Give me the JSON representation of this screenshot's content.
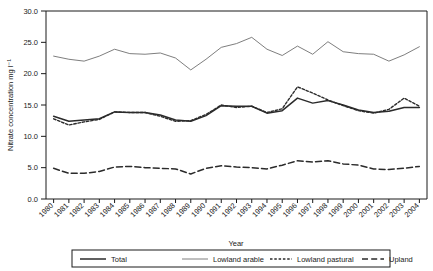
{
  "chart_data": {
    "type": "line",
    "title": "",
    "xlabel": "Year",
    "ylabel": "Nitrate concentration mg l⁻¹",
    "ylim": [
      0.0,
      30.0
    ],
    "yticks": [
      "0.0",
      "5.0",
      "10.0",
      "15.0",
      "20.0",
      "25.0",
      "30.0"
    ],
    "ytick_values": [
      0,
      5,
      10,
      15,
      20,
      25,
      30
    ],
    "grid": false,
    "legend_position": "bottom",
    "x": [
      1980,
      1981,
      1982,
      1983,
      1984,
      1985,
      1986,
      1987,
      1988,
      1989,
      1990,
      1991,
      1992,
      1993,
      1994,
      1995,
      1996,
      1997,
      1998,
      1999,
      2000,
      2001,
      2002,
      2003,
      2004
    ],
    "categories": [
      "1980",
      "1981",
      "1982",
      "1983",
      "1984",
      "1985",
      "1986",
      "1987",
      "1988",
      "1989",
      "1990",
      "1991",
      "1992",
      "1993",
      "1994",
      "1995",
      "1996",
      "1997",
      "1998",
      "1999",
      "2000",
      "2001",
      "2002",
      "2003",
      "2004"
    ],
    "series": [
      {
        "name": "Total",
        "style": "solid-thick",
        "color": "#2b2b2b",
        "values": [
          13.2,
          12.4,
          12.6,
          12.8,
          13.9,
          13.8,
          13.8,
          13.4,
          12.6,
          12.4,
          13.3,
          14.9,
          14.8,
          14.8,
          13.7,
          14.1,
          16.1,
          15.3,
          15.7,
          15.0,
          14.2,
          13.8,
          14.0,
          14.6,
          14.6
        ]
      },
      {
        "name": "Lowland arable",
        "style": "solid-thin",
        "color": "#6f6f6f",
        "values": [
          22.8,
          22.3,
          22.0,
          22.8,
          23.9,
          23.2,
          23.1,
          23.3,
          22.5,
          20.6,
          22.3,
          24.2,
          24.8,
          25.8,
          23.9,
          22.9,
          24.4,
          23.1,
          25.1,
          23.5,
          23.2,
          23.1,
          22.0,
          23.0,
          24.3
        ]
      },
      {
        "name": "Lowland pastural",
        "style": "dotted",
        "color": "#2b2b2b",
        "values": [
          12.8,
          11.8,
          12.3,
          12.7,
          13.9,
          13.8,
          13.8,
          13.2,
          12.4,
          12.5,
          13.5,
          15.0,
          14.6,
          14.8,
          13.8,
          14.4,
          17.9,
          16.9,
          15.8,
          14.9,
          14.1,
          13.7,
          14.3,
          16.1,
          14.8
        ]
      },
      {
        "name": "Upland",
        "style": "dashed",
        "color": "#2b2b2b",
        "values": [
          4.9,
          4.1,
          4.1,
          4.4,
          5.1,
          5.2,
          5.0,
          4.9,
          4.8,
          4.0,
          4.9,
          5.3,
          5.1,
          5.0,
          4.8,
          5.4,
          6.1,
          5.9,
          6.1,
          5.6,
          5.4,
          4.8,
          4.7,
          4.9,
          5.2
        ]
      }
    ]
  },
  "legend": {
    "items": [
      {
        "label": "Total"
      },
      {
        "label": "Lowland arable"
      },
      {
        "label": "Lowland pastural"
      },
      {
        "label": "Upland"
      }
    ]
  },
  "axes": {
    "y_title": "Nitrate concentration mg l⁻¹",
    "x_title": "Year"
  }
}
